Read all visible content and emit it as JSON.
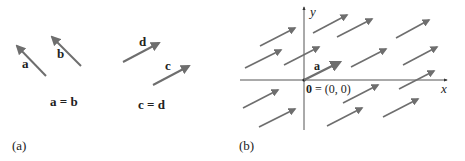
{
  "colors": {
    "arrow": "#6e6e6e",
    "axis": "#555555",
    "text": "#222222",
    "background": "#ffffff"
  },
  "panel_a": {
    "caption": "(a)",
    "arrows": [
      {
        "label": "a",
        "tail": [
          46,
          76
        ],
        "head": [
          17,
          46
        ],
        "label_pos": [
          22,
          68
        ]
      },
      {
        "label": "b",
        "tail": [
          81,
          66
        ],
        "head": [
          52,
          37
        ],
        "label_pos": [
          57,
          58
        ]
      },
      {
        "label": "d",
        "tail": [
          123,
          62
        ],
        "head": [
          159,
          43
        ],
        "label_pos": [
          139,
          46
        ]
      },
      {
        "label": "c",
        "tail": [
          153,
          85
        ],
        "head": [
          189,
          66
        ],
        "label_pos": [
          165,
          70
        ]
      }
    ],
    "equation_left": "a = b",
    "equation_right": "c = d"
  },
  "panel_b": {
    "caption": "(b)",
    "x_axis_label": "x",
    "y_axis_label": "y",
    "origin_label_bold": "0",
    "origin_label_rest": " = (0, 0)",
    "highlight_arrow_label": "a",
    "arrows": [
      {
        "tail": [
          260,
          46
        ],
        "head": [
          295,
          28
        ]
      },
      {
        "tail": [
          313,
          33
        ],
        "head": [
          347,
          15
        ]
      },
      {
        "tail": [
          337,
          37
        ],
        "head": [
          372,
          19
        ]
      },
      {
        "tail": [
          396,
          38
        ],
        "head": [
          429,
          20
        ]
      },
      {
        "tail": [
          245,
          68
        ],
        "head": [
          281,
          50
        ]
      },
      {
        "tail": [
          284,
          65
        ],
        "head": [
          319,
          47
        ]
      },
      {
        "tail": [
          351,
          67
        ],
        "head": [
          386,
          49
        ]
      },
      {
        "tail": [
          403,
          65
        ],
        "head": [
          437,
          47
        ]
      },
      {
        "tail": [
          399,
          89
        ],
        "head": [
          434,
          71
        ]
      },
      {
        "tail": [
          343,
          103
        ],
        "head": [
          378,
          85
        ]
      },
      {
        "tail": [
          243,
          108
        ],
        "head": [
          278,
          90
        ]
      },
      {
        "tail": [
          259,
          127
        ],
        "head": [
          295,
          109
        ]
      },
      {
        "tail": [
          327,
          126
        ],
        "head": [
          362,
          108
        ]
      },
      {
        "tail": [
          383,
          117
        ],
        "head": [
          418,
          99
        ]
      }
    ],
    "highlight_arrow": {
      "tail": [
        304,
        80
      ],
      "head": [
        340,
        62
      ]
    }
  }
}
